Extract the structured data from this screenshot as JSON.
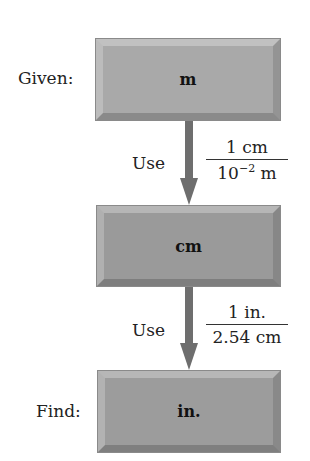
{
  "diagram": {
    "steps": [
      {
        "label": "Given:",
        "unit": "m"
      },
      {
        "label": "",
        "unit": "cm"
      },
      {
        "label": "Find:",
        "unit": "in."
      }
    ],
    "conversions": [
      {
        "use_label": "Use",
        "numerator": "1 cm",
        "denominator_base": "10",
        "denominator_exp": "−2",
        "denominator_unit": " m"
      },
      {
        "use_label": "Use",
        "numerator": "1 in.",
        "denominator": "2.54 cm"
      }
    ],
    "colors": {
      "box_fill": "#a9a9a9",
      "arrow": "#6e6e6e"
    }
  }
}
